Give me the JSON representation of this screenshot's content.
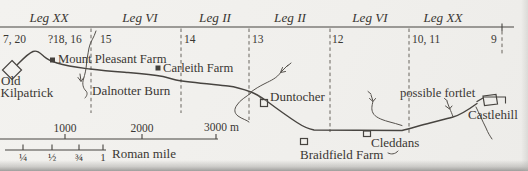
{
  "figure": {
    "ink_color": "#3a3733",
    "background_color": "#f1f0ed"
  },
  "legions": {
    "sectors": [
      "Leg XX",
      "Leg VI",
      "Leg II",
      "Leg II",
      "Leg VI",
      "Leg XX"
    ],
    "distance_slabs": [
      "7, 20",
      "?18, 16",
      "15",
      "14",
      "13",
      "12",
      "10, 11",
      "9"
    ]
  },
  "sites": {
    "old_kilpatrick_line1": "Old",
    "old_kilpatrick_line2": "Kilpatrick",
    "mount_pleasant_farm": "Mount Pleasant Farm",
    "dalnotter_burn": "Dalnotter Burn",
    "carleith_farm": "Carleith Farm",
    "duntocher": "Duntocher",
    "braidfield_farm": "Braidfield Farm",
    "cleddans": "Cleddans",
    "possible_fortlet": "possible fortlet",
    "castlehill": "Castlehill"
  },
  "scales": {
    "metres": {
      "ticks": [
        "1000",
        "2000",
        "3000 m"
      ]
    },
    "roman_mile": {
      "ticks": [
        "¼",
        "½",
        "¾",
        "1"
      ],
      "caption": "Roman mile"
    }
  }
}
